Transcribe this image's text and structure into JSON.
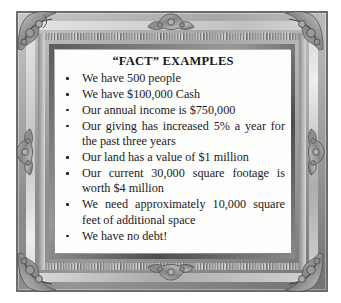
{
  "artwork": {
    "title": "“FACT” EXAMPLES",
    "bullets": [
      "We have 500 people",
      "We have $100,000 Cash",
      "Our annual income is $750,000",
      "Our giving has increased 5% a year for the past three years",
      "Our land has a value of $1 million",
      "Our current 30,000 square footage is worth $4 million",
      "We need approximately 10,000 square feet of additional space",
      "We have no debt!"
    ]
  },
  "frame": {
    "style_name": "ornate-gilt-picture-frame",
    "finish": "grayscale",
    "outer_color": "#6e6c69",
    "band_color": "#d2d0cc",
    "inner_lip_color": "#5f5d5a",
    "canvas_color": "#fdfdfc",
    "text_color": "#1b1a1e"
  }
}
